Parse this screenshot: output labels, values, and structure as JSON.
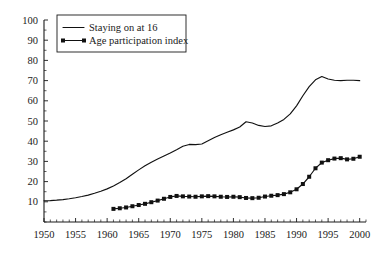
{
  "chart_data": {
    "type": "line",
    "title": "",
    "subtitle": "",
    "xlabel": "",
    "ylabel": "",
    "xlim": [
      1950,
      2001
    ],
    "ylim": [
      0,
      100
    ],
    "grid": false,
    "legend_position": "top-left",
    "x_ticks_major": [
      1950,
      1955,
      1960,
      1965,
      1970,
      1975,
      1980,
      1985,
      1990,
      1995,
      2000
    ],
    "x_tick_labels": [
      "1950",
      "1955",
      "1960",
      "1965",
      "1970",
      "1975",
      "1980",
      "1985",
      "1990",
      "1995",
      "2000"
    ],
    "x_tick_minor_step": 1,
    "y_ticks_major": [
      10,
      20,
      30,
      40,
      50,
      60,
      70,
      80,
      90,
      100
    ],
    "y_tick_labels": [
      "10",
      "20",
      "30",
      "40",
      "50",
      "60",
      "70",
      "80",
      "90",
      "100"
    ],
    "y_tick_minor_step": 5,
    "series": [
      {
        "name": "Staying on at 16",
        "style": "line",
        "markers": false,
        "color": "#111111",
        "x": [
          1950,
          1951,
          1952,
          1953,
          1954,
          1955,
          1956,
          1957,
          1958,
          1959,
          1960,
          1961,
          1962,
          1963,
          1964,
          1965,
          1966,
          1967,
          1968,
          1969,
          1970,
          1971,
          1972,
          1973,
          1974,
          1975,
          1976,
          1977,
          1978,
          1979,
          1980,
          1981,
          1982,
          1983,
          1984,
          1985,
          1986,
          1987,
          1988,
          1989,
          1990,
          1991,
          1992,
          1993,
          1994,
          1995,
          1996,
          1997,
          1998,
          1999,
          2000
        ],
        "values": [
          10.5,
          10.6,
          10.8,
          11.1,
          11.5,
          12.0,
          12.6,
          13.3,
          14.2,
          15.2,
          16.4,
          17.8,
          19.5,
          21.4,
          23.6,
          25.8,
          27.8,
          29.6,
          31.2,
          32.7,
          34.2,
          35.8,
          37.5,
          38.4,
          38.3,
          38.6,
          40.2,
          41.8,
          43.2,
          44.4,
          45.6,
          47.0,
          49.6,
          49.0,
          47.8,
          47.3,
          47.6,
          49.0,
          50.8,
          53.5,
          57.5,
          62.5,
          67.0,
          70.4,
          72.0,
          70.8,
          70.2,
          70.0,
          70.2,
          70.2,
          70.0
        ]
      },
      {
        "name": "Age participation index",
        "style": "line-markers",
        "markers": true,
        "color": "#111111",
        "x": [
          1961,
          1962,
          1963,
          1964,
          1965,
          1966,
          1967,
          1968,
          1969,
          1970,
          1971,
          1972,
          1973,
          1974,
          1975,
          1976,
          1977,
          1978,
          1979,
          1980,
          1981,
          1982,
          1983,
          1984,
          1985,
          1986,
          1987,
          1988,
          1989,
          1990,
          1991,
          1992,
          1993,
          1994,
          1995,
          1996,
          1997,
          1998,
          1999,
          2000
        ],
        "values": [
          6.5,
          6.8,
          7.2,
          7.8,
          8.4,
          9.0,
          9.8,
          10.6,
          11.5,
          12.4,
          12.9,
          12.7,
          12.6,
          12.5,
          12.7,
          12.8,
          12.7,
          12.5,
          12.4,
          12.5,
          12.3,
          11.9,
          11.8,
          12.0,
          12.6,
          13.0,
          13.3,
          13.8,
          14.7,
          16.2,
          18.8,
          22.4,
          26.6,
          29.4,
          30.6,
          31.4,
          31.6,
          31.0,
          31.3,
          32.3
        ]
      }
    ]
  },
  "legend": {
    "entries": [
      {
        "label": "Staying on at 16",
        "marker": "line"
      },
      {
        "label": "Age participation index",
        "marker": "line-with-squares"
      }
    ]
  }
}
